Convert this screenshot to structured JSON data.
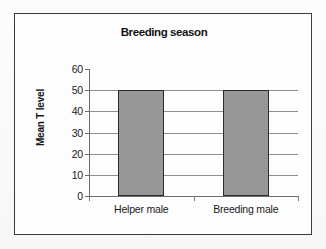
{
  "chart_data": {
    "type": "bar",
    "title": "Breeding season",
    "xlabel": "",
    "ylabel": "Mean T level",
    "categories": [
      "Helper male",
      "Breeding male"
    ],
    "values": [
      50,
      50
    ],
    "ylim": [
      0,
      60
    ],
    "ytick_labels": [
      "60",
      "50",
      "40",
      "30",
      "20",
      "10",
      "0"
    ],
    "ytick_values": [
      60,
      50,
      40,
      30,
      20,
      10,
      0
    ],
    "grid": true,
    "legend": "none",
    "bar_color": "#979797",
    "bar_border_color": "#2b2b2b",
    "gridline_color": "#8e8e8e",
    "axis_color": "#6d6d6d",
    "frame_color": "#3a3a3a",
    "text_color": "#141414",
    "plot_background": "#fdfdfd",
    "page_background": "#fbfbfb"
  }
}
